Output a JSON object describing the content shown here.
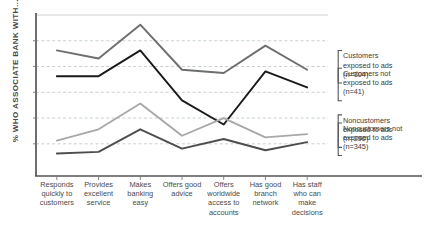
{
  "chart": {
    "ylabel": "% WHO ASSOCIATE BANK WITH…"
  },
  "chart_data": {
    "type": "line",
    "title": "",
    "xlabel": "",
    "ylabel": "% WHO ASSOCIATE BANK WITH…",
    "grid": true,
    "legend_position": "right",
    "ylim": [
      0,
      100
    ],
    "yticks_visible": false,
    "categories": [
      "Responds quickly to customers",
      "Provides excellent service",
      "Makes banking easy",
      "Offers good advice",
      "Offers worldwide access to accounts",
      "Has good branch network",
      "Has staff who can make decisions"
    ],
    "series": [
      {
        "name": "Customers exposed to ads (n=104)",
        "color": "#6e6e6e",
        "values": [
          78,
          73,
          94,
          66,
          64,
          81,
          66
        ]
      },
      {
        "name": "Customers not exposed to ads (n=41)",
        "color": "#1a1a1a",
        "values": [
          62,
          62,
          78,
          47,
          32,
          65,
          55
        ]
      },
      {
        "name": "Noncustomers exposed to ads (n=290)",
        "color": "#a8a8a8",
        "values": [
          22,
          29,
          45,
          25,
          36,
          24,
          26
        ]
      },
      {
        "name": "Noncustomers not exposed to ads (n=345)",
        "color": "#4d4d4d",
        "values": [
          14,
          15,
          29,
          17,
          23,
          16,
          21
        ]
      }
    ]
  },
  "legend": {
    "entries": [
      {
        "line1": "Customers",
        "line2": "exposed to ads",
        "line3": "(n=104)"
      },
      {
        "line1": "Customers not",
        "line2": "exposed to ads",
        "line3": "(n=41)"
      },
      {
        "line1": "Noncustomers",
        "line2": "exposed to ads",
        "line3": "(n=290)"
      },
      {
        "line1": "Noncustomers not",
        "line2": "exposed to ads",
        "line3": "(n=345)"
      }
    ]
  }
}
